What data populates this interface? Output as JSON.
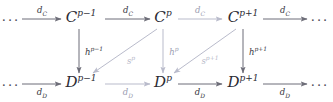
{
  "diagram": {
    "type": "commutative-diagram",
    "colors": {
      "node": "#2b2b33",
      "arrow_dark": "#6d6d78",
      "arrow_light": "#b9bbcb",
      "label_dark": "#34343d",
      "label_light": "#9a9cb0",
      "background": "#ffffff"
    },
    "ellipses": {
      "top_left": "···",
      "top_right": "···",
      "bottom_left": "···",
      "bottom_right": "···"
    },
    "top_row": {
      "name": "C-complex-row",
      "nodes": [
        {
          "base": "C",
          "exp": "p−1",
          "label": "C^{p-1}"
        },
        {
          "base": "C",
          "exp": "p",
          "label": "C^p"
        },
        {
          "base": "C",
          "exp": "p+1",
          "label": "C^{p+1}"
        }
      ]
    },
    "bottom_row": {
      "name": "D-complex-row",
      "nodes": [
        {
          "base": "D",
          "exp": "p−1",
          "label": "D^{p-1}"
        },
        {
          "base": "D",
          "exp": "p",
          "label": "D^p"
        },
        {
          "base": "D",
          "exp": "p+1",
          "label": "D^{p+1}"
        }
      ]
    },
    "horizontal_top_arrows": [
      {
        "base": "d",
        "sub": "C",
        "label": "d_C",
        "shade": "dark"
      },
      {
        "base": "d",
        "sub": "C",
        "label": "d_C",
        "shade": "dark"
      },
      {
        "base": "d",
        "sub": "C",
        "label": "d_C",
        "shade": "light"
      },
      {
        "base": "d",
        "sub": "C",
        "label": "d_C",
        "shade": "dark"
      }
    ],
    "horizontal_bottom_arrows": [
      {
        "base": "d",
        "sub": "D",
        "label": "d_D",
        "shade": "dark"
      },
      {
        "base": "d",
        "sub": "D",
        "label": "d_D",
        "shade": "light"
      },
      {
        "base": "d",
        "sub": "D",
        "label": "d_D",
        "shade": "dark"
      },
      {
        "base": "d",
        "sub": "D",
        "label": "d_D",
        "shade": "dark"
      }
    ],
    "vertical_arrows": [
      {
        "base": "h",
        "exp": "p−1",
        "label": "h^{p-1}",
        "shade": "dark"
      },
      {
        "base": "h",
        "exp": "p",
        "label": "h^p",
        "shade": "light"
      },
      {
        "base": "h",
        "exp": "p+1",
        "label": "h^{p+1}",
        "shade": "dark"
      }
    ],
    "diagonal_arrows": [
      {
        "base": "s",
        "exp": "p",
        "label": "s^p",
        "shade": "light"
      },
      {
        "base": "s",
        "exp": "p+1",
        "label": "s^{p+1}",
        "shade": "light"
      }
    ]
  }
}
